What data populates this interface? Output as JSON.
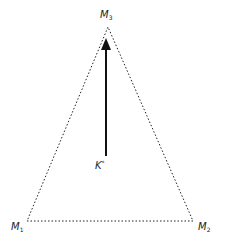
{
  "diagram": {
    "type": "triangle-with-arrow",
    "colors": {
      "stroke": "#222222",
      "background": "#ffffff"
    },
    "vertices": [
      {
        "id": "M1",
        "base": "M",
        "sub": "1",
        "x": 27,
        "y": 221
      },
      {
        "id": "M2",
        "base": "M",
        "sub": "2",
        "x": 193,
        "y": 221
      },
      {
        "id": "M3",
        "base": "M",
        "sub": "3",
        "x": 108,
        "y": 27
      }
    ],
    "arrow": {
      "from_label": {
        "base": "K",
        "sup": "*"
      },
      "x": 106,
      "y_start": 156,
      "y_end": 41
    }
  }
}
